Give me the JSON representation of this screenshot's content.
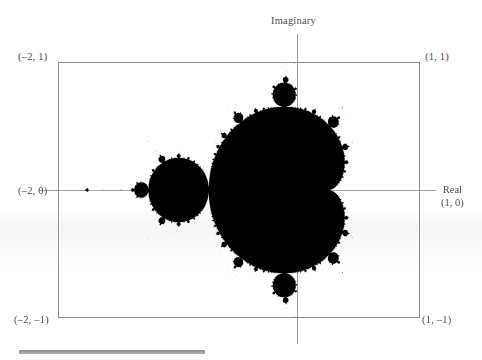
{
  "figure": {
    "kind": "mandelbrot-set-plot",
    "background_color": "#fdfdfd",
    "ink_color": "#000000",
    "frame_color": "#8f8f8f",
    "axis_color": "#9a9a9a",
    "label_color": "#4d4d4d",
    "rule_color": "#8d8d8d"
  },
  "axes": {
    "vertical_label": "Imaginary",
    "horizontal_label": "Real"
  },
  "corner_labels": {
    "top_left": "(–2, 1)",
    "top_right": "(1, 1)",
    "middle_left": "(–2, 0)",
    "middle_right": "(1, 0)",
    "bottom_left": "(–2, –1)",
    "bottom_right": "(1, –1)"
  },
  "chart_data": {
    "type": "heatmap",
    "title": "",
    "subtitle": "",
    "xlabel": "Real",
    "ylabel": "Imaginary",
    "xlim": [
      -2,
      1
    ],
    "ylim": [
      -1,
      1
    ],
    "grid": false,
    "legend": false,
    "render": {
      "formula": "z_{n+1} = z_n^2 + c,  z_0 = 0",
      "escape_radius": 2,
      "max_iterations": 400,
      "inside_color": "#000000",
      "outside_color": "#ffffff",
      "supersample": 3
    },
    "xticks": [
      -2,
      1
    ],
    "yticks": [
      -1,
      0,
      1
    ],
    "xticklabels": [
      "–2",
      "1"
    ],
    "yticklabels": [
      "–1",
      "0",
      "1"
    ],
    "annotations": [
      {
        "text": "(–2, 1)",
        "x": -2,
        "y": 1,
        "position": "top-left"
      },
      {
        "text": "(1, 1)",
        "x": 1,
        "y": 1,
        "position": "top-right"
      },
      {
        "text": "(–2, 0)",
        "x": -2,
        "y": 0,
        "position": "middle-left"
      },
      {
        "text": "(1, 0)",
        "x": 1,
        "y": 0,
        "position": "middle-right"
      },
      {
        "text": "(–2, –1)",
        "x": -2,
        "y": -1,
        "position": "bottom-left"
      },
      {
        "text": "(1, –1)",
        "x": 1,
        "y": -1,
        "position": "bottom-right"
      },
      {
        "text": "Imaginary",
        "x": 0,
        "y": 1,
        "position": "above-axis"
      },
      {
        "text": "Real",
        "x": 1,
        "y": 0,
        "position": "right-of-axis"
      }
    ]
  }
}
